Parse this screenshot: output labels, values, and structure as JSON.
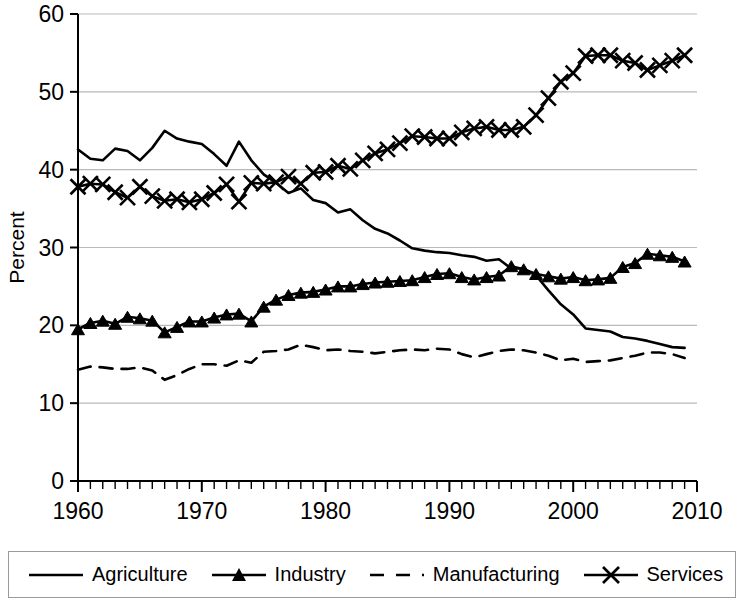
{
  "chart_data": {
    "type": "line",
    "title": "",
    "xlabel": "Year",
    "ylabel": "Percent",
    "xlim": [
      1960,
      2010
    ],
    "ylim": [
      0,
      60
    ],
    "xticks": [
      1960,
      1970,
      1980,
      1990,
      2000,
      2010
    ],
    "yticks": [
      0,
      10,
      20,
      30,
      40,
      50,
      60
    ],
    "xtick_labels": [
      "1960",
      "1970",
      "1980",
      "1990",
      "2000",
      "2010"
    ],
    "ytick_labels": [
      "0",
      "10",
      "20",
      "30",
      "40",
      "50",
      "60"
    ],
    "x_minor_tick_interval": 1,
    "grid": "horizontal",
    "legend_position": "bottom",
    "x": [
      1960,
      1961,
      1962,
      1963,
      1964,
      1965,
      1966,
      1967,
      1968,
      1969,
      1970,
      1971,
      1972,
      1973,
      1974,
      1975,
      1976,
      1977,
      1978,
      1979,
      1980,
      1981,
      1982,
      1983,
      1984,
      1985,
      1986,
      1987,
      1988,
      1989,
      1990,
      1991,
      1992,
      1993,
      1994,
      1995,
      1996,
      1997,
      1998,
      1999,
      2000,
      2001,
      2002,
      2003,
      2004,
      2005,
      2006,
      2007,
      2008,
      2009
    ],
    "series": [
      {
        "name": "Agriculture",
        "style": "solid",
        "marker": "none",
        "color": "#000000",
        "values": [
          42.6,
          41.4,
          41.2,
          42.7,
          42.4,
          41.2,
          42.8,
          45.0,
          44.0,
          43.6,
          43.3,
          42.0,
          40.5,
          43.6,
          41.2,
          39.4,
          38.3,
          37.0,
          37.6,
          36.1,
          35.7,
          34.5,
          34.9,
          33.5,
          32.4,
          31.8,
          30.9,
          29.9,
          29.6,
          29.4,
          29.3,
          29.0,
          28.8,
          28.3,
          28.5,
          27.3,
          27.3,
          26.4,
          24.5,
          22.7,
          21.4,
          19.6,
          19.4,
          19.2,
          18.5,
          18.3,
          18.0,
          17.6,
          17.2,
          17.1
        ]
      },
      {
        "name": "Industry",
        "style": "solid",
        "marker": "triangle",
        "color": "#000000",
        "values": [
          19.5,
          20.3,
          20.6,
          20.2,
          21.1,
          20.9,
          20.6,
          19.1,
          19.8,
          20.5,
          20.5,
          21.0,
          21.4,
          21.5,
          20.5,
          22.4,
          23.3,
          23.9,
          24.2,
          24.3,
          24.6,
          25.0,
          25.0,
          25.3,
          25.5,
          25.6,
          25.7,
          25.8,
          26.2,
          26.6,
          26.7,
          26.2,
          25.9,
          26.2,
          26.4,
          27.6,
          27.2,
          26.6,
          26.3,
          26.0,
          26.2,
          25.8,
          25.9,
          26.1,
          27.5,
          28.0,
          29.2,
          29.0,
          28.8,
          28.2
        ]
      },
      {
        "name": "Manufacturing",
        "style": "dashed",
        "marker": "none",
        "color": "#000000",
        "values": [
          14.3,
          14.7,
          14.6,
          14.4,
          14.4,
          14.6,
          14.2,
          13.0,
          13.6,
          14.4,
          15.0,
          15.0,
          14.8,
          15.5,
          15.2,
          16.6,
          16.7,
          16.9,
          17.5,
          17.2,
          16.8,
          16.9,
          16.7,
          16.6,
          16.4,
          16.6,
          16.8,
          16.9,
          16.8,
          17.0,
          16.9,
          16.3,
          15.9,
          16.3,
          16.7,
          16.9,
          16.8,
          16.5,
          16.1,
          15.5,
          15.7,
          15.3,
          15.4,
          15.5,
          15.8,
          16.1,
          16.5,
          16.5,
          16.3,
          15.8
        ]
      },
      {
        "name": "Services",
        "style": "solid",
        "marker": "x",
        "color": "#000000",
        "values": [
          37.8,
          38.2,
          38.1,
          37.1,
          36.4,
          37.8,
          36.6,
          36.0,
          36.2,
          35.8,
          36.2,
          37.0,
          38.1,
          35.9,
          38.3,
          38.2,
          38.4,
          39.1,
          38.2,
          39.6,
          39.7,
          40.5,
          40.1,
          41.2,
          42.1,
          42.6,
          43.4,
          44.3,
          44.2,
          44.0,
          44.0,
          44.8,
          45.3,
          45.5,
          45.1,
          45.1,
          45.5,
          47.0,
          49.2,
          51.3,
          52.4,
          54.6,
          54.7,
          54.7,
          54.0,
          53.7,
          52.8,
          53.4,
          54.0,
          54.7
        ]
      }
    ]
  },
  "legend": {
    "items": [
      {
        "label": "Agriculture",
        "swatch": "line-plain"
      },
      {
        "label": "Industry",
        "swatch": "line-triangle"
      },
      {
        "label": "Manufacturing",
        "swatch": "line-dashed"
      },
      {
        "label": "Services",
        "swatch": "line-x"
      }
    ]
  },
  "axes": {
    "x_title": "Year",
    "y_title": "Percent"
  }
}
